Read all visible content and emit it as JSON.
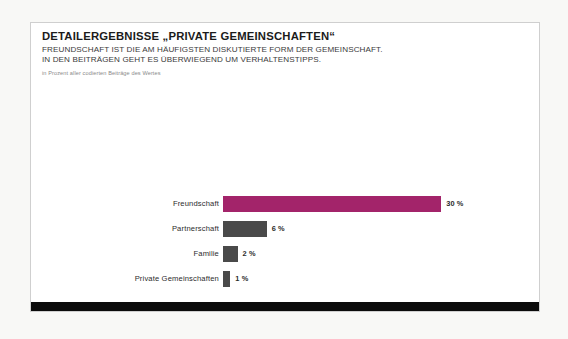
{
  "slide": {
    "title": "DETAILERGEBNISSE „PRIVATE GEMEINSCHAFTEN“",
    "subtitle_line_1": "FREUNDSCHAFT IST DIE AM HÄUFIGSTEN DISKUTIERTE FORM DER GEMEINSCHAFT.",
    "subtitle_line_2": "IN DEN BEITRÄGEN GEHT ES ÜBERWIEGEND UM VERHALTENSTIPPS.",
    "source_note": "in Prozent aller codierten Beiträge des Wertes"
  },
  "colors": {
    "accent_magenta": "#A3246A",
    "bar_gray": "#4A4A4A",
    "band_black": "#0B0B0B",
    "slide_background": "#FFFFFF",
    "page_background": "#F8F8F6",
    "slide_border": "#CFCFCF"
  },
  "chart_data": {
    "type": "bar",
    "orientation": "horizontal",
    "title": "DETAILERGEBNISSE „PRIVATE GEMEINSCHAFTEN“",
    "subtitle": "FREUNDSCHAFT IST DIE AM HÄUFIGSTEN DISKUTIERTE FORM DER GEMEINSCHAFT. IN DEN BEITRÄGEN GEHT ES ÜBERWIEGEND UM VERHALTENSTIPPS.",
    "unit_note": "in Prozent aller codierten Beiträge des Wertes",
    "xlabel": "",
    "ylabel": "",
    "xlim": [
      0,
      33
    ],
    "grid": false,
    "legend": false,
    "categories": [
      "Freundschaft",
      "Partnerschaft",
      "Familie",
      "Private Gemeinschaften"
    ],
    "values": [
      30,
      6,
      2,
      1
    ],
    "value_labels": [
      "30 %",
      "6 %",
      "2 %",
      "1 %"
    ],
    "bar_colors": [
      "#A3246A",
      "#4A4A4A",
      "#4A4A4A",
      "#4A4A4A"
    ],
    "bars": [
      {
        "label": "Freundschaft",
        "value": 30,
        "value_label": "30 %",
        "color": "#A3246A"
      },
      {
        "label": "Partnerschaft",
        "value": 6,
        "value_label": "6 %",
        "color": "#4A4A4A"
      },
      {
        "label": "Familie",
        "value": 2,
        "value_label": "2 %",
        "color": "#4A4A4A"
      },
      {
        "label": "Private Gemeinschaften",
        "value": 1,
        "value_label": "1 %",
        "color": "#4A4A4A"
      }
    ]
  }
}
